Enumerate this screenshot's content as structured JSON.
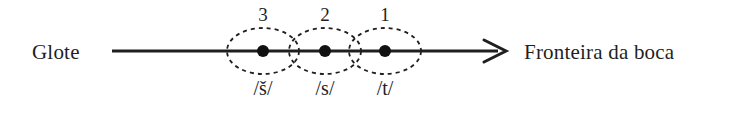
{
  "figure": {
    "background_color": "#ffffff",
    "ink_color": "#1f1f1f",
    "axis": {
      "left_label": "Glote",
      "right_label": "Fronteira da boca",
      "arrow_direction": "right",
      "line_start_x": 112,
      "line_end_x": 505,
      "line_y": 51
    },
    "segments": [
      {
        "number": "3",
        "phoneme": "/š/",
        "center_x": 263,
        "ellipse_rx": 36,
        "ellipse_ry": 23
      },
      {
        "number": "2",
        "phoneme": "/s/",
        "center_x": 325,
        "ellipse_rx": 36,
        "ellipse_ry": 23
      },
      {
        "number": "1",
        "phoneme": "/t/",
        "center_x": 385,
        "ellipse_rx": 36,
        "ellipse_ry": 23
      }
    ]
  }
}
